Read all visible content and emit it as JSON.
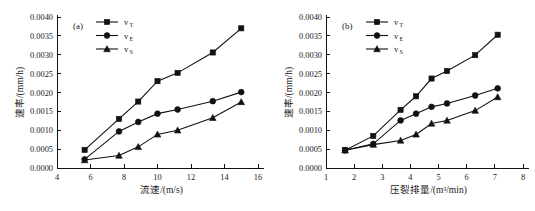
{
  "figure": {
    "background": "#ffffff",
    "ink_color": "#111111"
  },
  "chart_data": [
    {
      "type": "line",
      "panel_tag": "(a)",
      "title": "",
      "xlabel": "流速/(m/s)",
      "ylabel": "速率/(mm/h)",
      "xlim": [
        4,
        16
      ],
      "ylim": [
        0.0,
        0.004
      ],
      "xticks": [
        4,
        6,
        8,
        10,
        12,
        14,
        16
      ],
      "xtick_labels": [
        "4",
        "6",
        "8",
        "10",
        "12",
        "14",
        "16"
      ],
      "yticks": [
        0.0,
        0.0005,
        0.001,
        0.0015,
        0.002,
        0.0025,
        0.003,
        0.0035,
        0.004
      ],
      "ytick_labels": [
        "0.0000",
        "0.0005",
        "0.0010",
        "0.0015",
        "0.0020",
        "0.0025",
        "0.0030",
        "0.0035",
        "0.0040"
      ],
      "grid": false,
      "legend_position": "top-center",
      "series": [
        {
          "name": "v_T",
          "label_base": "v",
          "label_sub": "T",
          "marker": "square",
          "x": [
            5.65,
            7.7,
            8.85,
            10.0,
            11.2,
            13.3,
            15.0
          ],
          "values": [
            0.00048,
            0.0013,
            0.00176,
            0.0023,
            0.00252,
            0.00306,
            0.0037
          ]
        },
        {
          "name": "v_E",
          "label_base": "v",
          "label_sub": "E",
          "marker": "circle",
          "x": [
            5.65,
            7.7,
            8.85,
            10.0,
            11.2,
            13.3,
            15.0
          ],
          "values": [
            0.00023,
            0.00097,
            0.00122,
            0.00144,
            0.00155,
            0.00177,
            0.00201
          ]
        },
        {
          "name": "v_S",
          "label_base": "v",
          "label_sub": "S",
          "marker": "triangle",
          "x": [
            5.65,
            7.7,
            8.85,
            10.0,
            11.2,
            13.3,
            15.0
          ],
          "values": [
            0.00021,
            0.00033,
            0.00056,
            0.00089,
            0.001,
            0.00133,
            0.00175
          ]
        }
      ]
    },
    {
      "type": "line",
      "panel_tag": "(b)",
      "title": "",
      "xlabel": "压裂排量/(m³/min)",
      "ylabel": "速率/(mm/h)",
      "xlim": [
        1,
        8
      ],
      "ylim": [
        0.0,
        0.004
      ],
      "xticks": [
        1,
        2,
        3,
        4,
        5,
        6,
        7,
        8
      ],
      "xtick_labels": [
        "1",
        "2",
        "3",
        "4",
        "5",
        "6",
        "7",
        "8"
      ],
      "yticks": [
        0.0,
        0.0005,
        0.001,
        0.0015,
        0.002,
        0.0025,
        0.003,
        0.0035,
        0.004
      ],
      "ytick_labels": [
        "0.0000",
        "0.0005",
        "0.0010",
        "0.0015",
        "0.0020",
        "0.0025",
        "0.0030",
        "0.0035",
        "0.0040"
      ],
      "grid": false,
      "legend_position": "top-center",
      "series": [
        {
          "name": "v_T",
          "label_base": "v",
          "label_sub": "T",
          "marker": "square",
          "x": [
            1.68,
            2.68,
            3.65,
            4.2,
            4.75,
            5.3,
            6.3,
            7.1
          ],
          "values": [
            0.00047,
            0.00085,
            0.00154,
            0.0019,
            0.00237,
            0.00257,
            0.00299,
            0.00353
          ]
        },
        {
          "name": "v_E",
          "label_base": "v",
          "label_sub": "E",
          "marker": "circle",
          "x": [
            1.68,
            2.68,
            3.65,
            4.2,
            4.75,
            5.3,
            6.3,
            7.1
          ],
          "values": [
            0.00047,
            0.00064,
            0.00126,
            0.00144,
            0.00162,
            0.00171,
            0.00192,
            0.00211
          ]
        },
        {
          "name": "v_S",
          "label_base": "v",
          "label_sub": "S",
          "marker": "triangle",
          "x": [
            1.68,
            2.68,
            3.65,
            4.2,
            4.75,
            5.3,
            6.3,
            7.1
          ],
          "values": [
            0.00047,
            0.00062,
            0.00073,
            0.00089,
            0.00118,
            0.00126,
            0.00152,
            0.00188
          ]
        }
      ]
    }
  ]
}
